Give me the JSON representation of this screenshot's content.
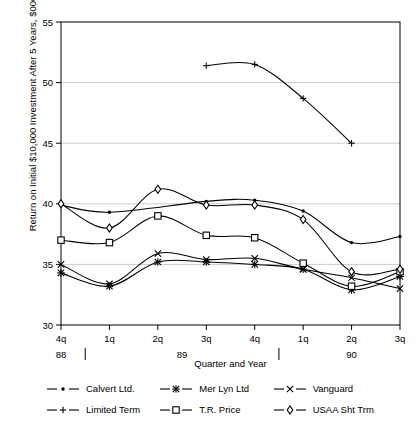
{
  "chart_data": {
    "type": "line",
    "title": "",
    "xlabel": "Quarter and Year",
    "ylabel": "Return on Initial $10,000 Investment After 5 Years, $000",
    "ylim": [
      30,
      55
    ],
    "yticks": [
      30,
      35,
      40,
      45,
      50,
      55
    ],
    "grid": "horizontal",
    "legend_position": "below",
    "categories": [
      "4q",
      "1q",
      "2q",
      "3q",
      "4q",
      "1q",
      "2q",
      "3q"
    ],
    "year_groups": [
      {
        "label": "88",
        "from": 0,
        "to": 0
      },
      {
        "label": "89",
        "from": 1,
        "to": 4
      },
      {
        "label": "90",
        "from": 5,
        "to": 7
      }
    ],
    "series": [
      {
        "name": "Calvert Ltd.",
        "marker": "filled-dot",
        "values": [
          39.9,
          39.3,
          null,
          40.2,
          40.3,
          39.4,
          36.8,
          37.3
        ]
      },
      {
        "name": "Limited Term",
        "marker": "plus",
        "values": [
          null,
          null,
          null,
          51.4,
          51.5,
          48.7,
          45.0,
          null
        ]
      },
      {
        "name": "Mer Lyn Ltd",
        "marker": "asterisk",
        "values": [
          34.3,
          33.2,
          35.2,
          35.2,
          35.0,
          34.6,
          32.9,
          34.0
        ]
      },
      {
        "name": "T.R. Price",
        "marker": "square",
        "values": [
          37.0,
          36.8,
          39.0,
          37.4,
          37.2,
          35.1,
          33.2,
          34.4
        ]
      },
      {
        "name": "Vanguard",
        "marker": "x",
        "values": [
          35.0,
          33.4,
          35.9,
          35.4,
          35.5,
          34.6,
          33.9,
          33.0
        ]
      },
      {
        "name": "USAA Sht Trm",
        "marker": "diamond",
        "values": [
          40.0,
          38.0,
          41.2,
          39.9,
          39.9,
          38.7,
          34.4,
          34.6
        ]
      }
    ],
    "colors": {
      "line": "#000000",
      "grid": "#cccccc",
      "frame": "#000000",
      "background": "#ffffff"
    }
  },
  "legend": {
    "entries": [
      {
        "label": "Calvert Ltd.",
        "marker": "filled-dot"
      },
      {
        "label": "Limited Term",
        "marker": "plus"
      },
      {
        "label": "Mer Lyn Ltd",
        "marker": "asterisk"
      },
      {
        "label": "T.R. Price",
        "marker": "square"
      },
      {
        "label": "Vanguard",
        "marker": "x"
      },
      {
        "label": "USAA Sht Trm",
        "marker": "diamond"
      }
    ]
  }
}
